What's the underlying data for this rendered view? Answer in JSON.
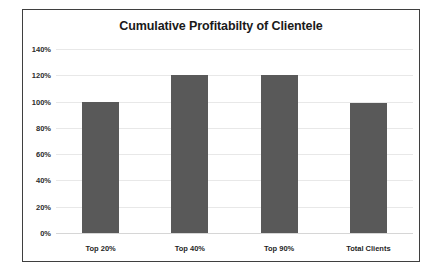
{
  "chart_data": {
    "type": "bar",
    "title": "Cumulative Profitabilty of Clientele",
    "xlabel": "",
    "ylabel": "",
    "categories": [
      "Top 20%",
      "Top 40%",
      "Top 90%",
      "Total Clients"
    ],
    "values": [
      100,
      120,
      120,
      99
    ],
    "value_unit": "%",
    "ylim": [
      0,
      140
    ],
    "ytick_values": [
      0,
      20,
      40,
      60,
      80,
      100,
      120,
      140
    ],
    "ytick_labels": [
      "0%",
      "20%",
      "40%",
      "60%",
      "80%",
      "100%",
      "120%",
      "140%"
    ],
    "grid": true,
    "legend": false,
    "series": [
      {
        "name": "Cumulative Profitability",
        "values": [
          100,
          120,
          120,
          99
        ]
      }
    ],
    "colors": {
      "bar_fill": "#595959",
      "gridline": "#e8e8e8",
      "frame_border": "#3f3f3f",
      "title_text": "#1a1a1a",
      "tick_text": "#2b2b2b",
      "plot_background": "#ffffff"
    }
  }
}
